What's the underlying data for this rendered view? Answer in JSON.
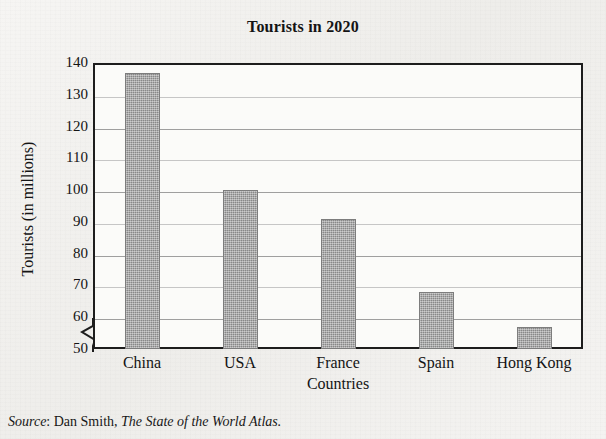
{
  "chart_data": {
    "type": "bar",
    "title": "Tourists in 2020",
    "xlabel": "Countries",
    "ylabel": "Tourists (in millions)",
    "categories": [
      "China",
      "USA",
      "France",
      "Spain",
      "Hong Kong"
    ],
    "values": [
      137,
      100,
      91,
      68,
      57
    ],
    "ylim": [
      50,
      140
    ],
    "yticks": [
      50,
      60,
      70,
      80,
      90,
      100,
      110,
      120,
      130,
      140
    ],
    "ytick_labels": [
      "50",
      "60",
      "70",
      "80",
      "90",
      "100",
      "110",
      "120",
      "130",
      "140"
    ],
    "grid": true,
    "legend": "none",
    "axis_break": true,
    "bar_color": "#9b9b9b",
    "bar_edge_color": "#7d7d7d",
    "frame_color": "#1d1d1d",
    "background_color": "#f3f2f0",
    "plot_background_color": "#fbfbf9",
    "annotations": []
  },
  "source": {
    "label": "Source",
    "separator": ": ",
    "author": "Dan Smith, ",
    "work": "The State of the World Atlas."
  }
}
